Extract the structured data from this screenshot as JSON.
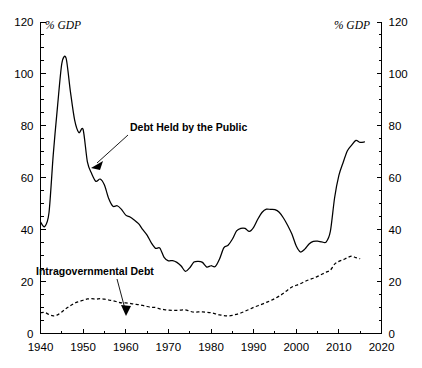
{
  "chart_data": {
    "type": "line",
    "title": "",
    "xlabel": "",
    "ylabel": "",
    "left_axis_unit": "% GDP",
    "right_axis_unit": "% GDP",
    "xlim": [
      1940,
      2020
    ],
    "ylim": [
      0,
      120
    ],
    "x_ticks": [
      1940,
      1950,
      1960,
      1970,
      1980,
      1990,
      2000,
      2010,
      2020
    ],
    "x_tick_labels": [
      "1940",
      "1950",
      "1960",
      "1970",
      "1980",
      "1990",
      "2000",
      "2010",
      "2020"
    ],
    "x_minor_tick_interval": 5,
    "y_ticks": [
      0,
      20,
      40,
      60,
      80,
      100,
      120
    ],
    "y_tick_labels": [
      "0",
      "20",
      "40",
      "60",
      "80",
      "100",
      "120"
    ],
    "y_minor_tick_interval": 5,
    "grid": false,
    "legend": "inline-annotations",
    "series": [
      {
        "name": "Debt Held by the Public",
        "style": "solid",
        "color": "#000000",
        "annotation_label": "Debt Held by the Public",
        "x": [
          1940,
          1941,
          1942,
          1943,
          1944,
          1945,
          1946,
          1947,
          1948,
          1949,
          1950,
          1951,
          1952,
          1953,
          1954,
          1955,
          1956,
          1957,
          1958,
          1959,
          1960,
          1961,
          1962,
          1963,
          1964,
          1965,
          1966,
          1967,
          1968,
          1969,
          1970,
          1971,
          1972,
          1973,
          1974,
          1975,
          1976,
          1977,
          1978,
          1979,
          1980,
          1981,
          1982,
          1983,
          1984,
          1985,
          1986,
          1987,
          1988,
          1989,
          1990,
          1991,
          1992,
          1993,
          1994,
          1995,
          1996,
          1997,
          1998,
          1999,
          2000,
          2001,
          2002,
          2003,
          2004,
          2005,
          2006,
          2007,
          2008,
          2009,
          2010,
          2011,
          2012,
          2013,
          2014,
          2015,
          2016
        ],
        "values": [
          43.0,
          41.2,
          46.6,
          69.1,
          87.6,
          104.0,
          106.1,
          93.4,
          82.3,
          77.4,
          78.6,
          66.1,
          61.6,
          58.6,
          59.5,
          57.2,
          52.0,
          49.0,
          49.2,
          47.8,
          45.6,
          44.9,
          43.7,
          42.3,
          40.0,
          37.9,
          34.9,
          32.8,
          32.9,
          29.3,
          28.0,
          28.1,
          27.4,
          26.0,
          23.9,
          25.3,
          27.5,
          27.8,
          27.4,
          25.6,
          26.1,
          25.8,
          28.7,
          33.0,
          34.0,
          36.3,
          39.5,
          40.5,
          40.5,
          39.3,
          40.9,
          44.1,
          46.7,
          47.9,
          47.8,
          47.7,
          46.7,
          44.5,
          41.6,
          38.2,
          33.7,
          31.4,
          32.5,
          34.5,
          35.5,
          35.6,
          35.3,
          35.2,
          39.3,
          52.3,
          60.9,
          65.9,
          70.4,
          72.6,
          74.4,
          73.6,
          73.8
        ]
      },
      {
        "name": "Intragovernmental Debt",
        "style": "dashed",
        "color": "#000000",
        "annotation_label": "Intragovernmental Debt",
        "x": [
          1940,
          1941,
          1942,
          1943,
          1944,
          1945,
          1946,
          1947,
          1948,
          1949,
          1950,
          1951,
          1952,
          1953,
          1954,
          1955,
          1956,
          1957,
          1958,
          1959,
          1960,
          1961,
          1962,
          1963,
          1964,
          1965,
          1966,
          1967,
          1968,
          1969,
          1970,
          1971,
          1972,
          1973,
          1974,
          1975,
          1976,
          1977,
          1978,
          1979,
          1980,
          1981,
          1982,
          1983,
          1984,
          1985,
          1986,
          1987,
          1988,
          1989,
          1990,
          1991,
          1992,
          1993,
          1994,
          1995,
          1996,
          1997,
          1998,
          1999,
          2000,
          2001,
          2002,
          2003,
          2004,
          2005,
          2006,
          2007,
          2008,
          2009,
          2010,
          2011,
          2012,
          2013,
          2014,
          2015
        ],
        "values": [
          8.0,
          8.1,
          7.3,
          6.8,
          7.2,
          8.3,
          9.6,
          10.7,
          11.7,
          12.3,
          12.8,
          13.3,
          13.4,
          13.2,
          13.4,
          13.2,
          12.9,
          12.6,
          12.2,
          11.8,
          11.8,
          11.6,
          11.3,
          11.1,
          10.8,
          10.4,
          10.1,
          10.0,
          9.5,
          9.2,
          9.0,
          8.9,
          8.9,
          9.0,
          9.1,
          8.6,
          8.2,
          8.3,
          8.3,
          8.2,
          8.0,
          7.6,
          7.2,
          6.9,
          6.8,
          7.0,
          7.4,
          7.9,
          8.6,
          9.3,
          10.1,
          10.7,
          11.3,
          12.0,
          12.7,
          13.5,
          14.4,
          15.5,
          16.8,
          17.9,
          18.6,
          19.2,
          20.0,
          20.7,
          21.3,
          22.0,
          22.8,
          23.6,
          24.4,
          26.7,
          27.8,
          28.4,
          29.2,
          29.8,
          29.2,
          28.8
        ]
      }
    ]
  },
  "annotations": {
    "public_label": "Debt Held by the Public",
    "intragov_label": "Intragovernmental Debt"
  },
  "axes": {
    "left_unit": "% GDP",
    "right_unit": "% GDP"
  }
}
